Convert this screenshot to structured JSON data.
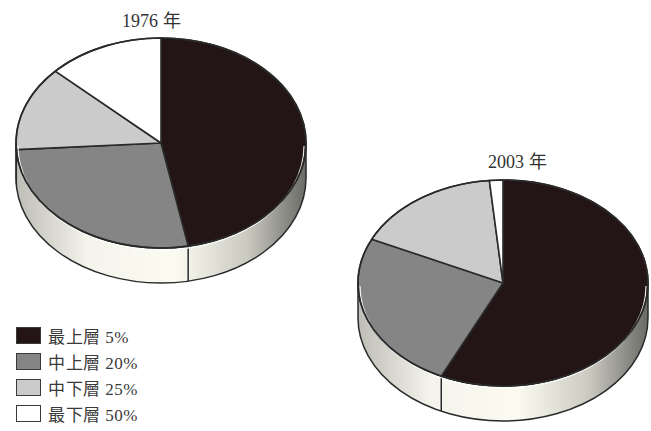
{
  "chart_data": {
    "type": "pie",
    "style": "3d",
    "legend": {
      "position": "bottom-left",
      "entries": [
        {
          "label": "最上層 5%",
          "color": "#231416"
        },
        {
          "label": "中上層 20%",
          "color": "#858585"
        },
        {
          "label": "中下層 25%",
          "color": "#cbcbcb"
        },
        {
          "label": "最下層 50%",
          "color": "#ffffff"
        }
      ]
    },
    "categories": [
      "最上層 5%",
      "中上層 20%",
      "中下層 25%",
      "最下層 50%"
    ],
    "charts": [
      {
        "title": "1976 年",
        "values": [
          47,
          27,
          13,
          13
        ],
        "unit": "% share (estimated from slice angles)"
      },
      {
        "title": "2003 年",
        "values": [
          57,
          25,
          16.5,
          1.5
        ],
        "unit": "% share (estimated from slice angles)"
      }
    ]
  },
  "colors": {
    "top": "#231416",
    "upper_middle": "#858585",
    "lower_middle": "#cbcbcb",
    "bottom": "#ffffff",
    "outline": "#2a2a2a"
  }
}
